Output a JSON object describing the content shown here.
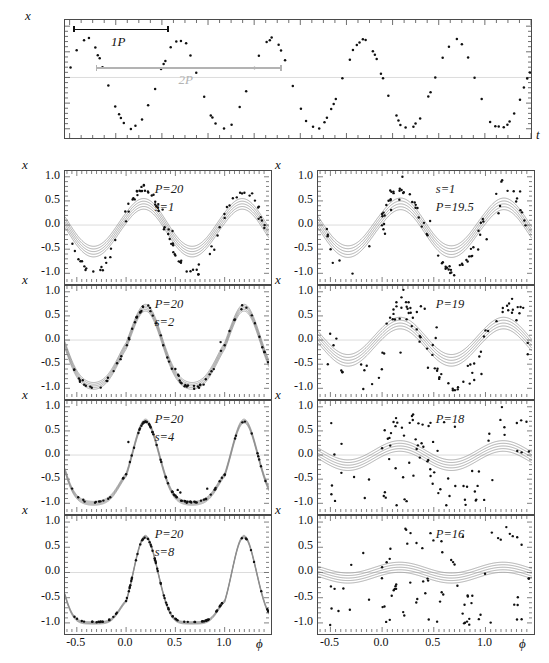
{
  "figure": {
    "axis_labels": {
      "x_var": "x",
      "time_var": "t",
      "phase_var": "ϕ"
    }
  },
  "top_panel": {
    "name": "time-series-panel",
    "ylabel": "x",
    "xlabel": "t",
    "ytick_labels": [
      "1.0",
      "0.5",
      "0.0",
      "-0.5",
      "-1.0"
    ],
    "ytick_values": [
      1.0,
      0.5,
      0.0,
      -0.5,
      -1.0
    ],
    "xtick_labels": [
      "0",
      "20",
      "40",
      "60",
      "80"
    ],
    "xtick_values": [
      0,
      20,
      40,
      60,
      80
    ],
    "xlim": [
      -1,
      100
    ],
    "ylim": [
      -1.18,
      1.12
    ],
    "legend": [
      {
        "label": "1P",
        "color": "#101010",
        "x_start": 1.2,
        "x_end": 21.5,
        "y": 0.93
      },
      {
        "label": "2P",
        "color": "#b3b3b3",
        "x_start": 6.0,
        "x_end": 46.0,
        "y": 0.18
      }
    ]
  },
  "subpanels": {
    "xtick_labels": [
      "-0.5",
      "0.0",
      "0.5",
      "1.0"
    ],
    "xtick_values": [
      -0.5,
      0.0,
      0.5,
      1.0
    ],
    "ytick_labels": [
      "1.0",
      "0.5",
      "0.0",
      "-0.5",
      "-1.0"
    ],
    "ytick_values": [
      1.0,
      0.5,
      0.0,
      -0.5,
      -1.0
    ],
    "xlim": [
      -0.62,
      1.45
    ],
    "ylim": [
      -1.18,
      1.12
    ],
    "ylabel": "x",
    "xlabel": "ϕ"
  },
  "left_column": [
    {
      "name": "panel-P20-s1",
      "annotations": [
        "P=20",
        "s=1"
      ],
      "period": 20,
      "smooth": 1,
      "scatter_sigma": 0.16,
      "band_amp": 0.55,
      "band_spread": 0.055,
      "sharp": 0.25,
      "outlier_frac": 0.3
    },
    {
      "name": "panel-P20-s2",
      "annotations": [
        "P=20",
        "s=2"
      ],
      "period": 20,
      "smooth": 2,
      "scatter_sigma": 0.055,
      "band_amp": 0.95,
      "band_spread": 0.035,
      "sharp": 0.62,
      "outlier_frac": 0.1
    },
    {
      "name": "panel-P20-s4",
      "annotations": [
        "P=20",
        "s=4"
      ],
      "period": 20,
      "smooth": 4,
      "scatter_sigma": 0.018,
      "band_amp": 1.0,
      "band_spread": 0.02,
      "sharp": 0.85,
      "outlier_frac": 0.03
    },
    {
      "name": "panel-P20-s8",
      "annotations": [
        "P=20",
        "s=8"
      ],
      "period": 20,
      "smooth": 8,
      "scatter_sigma": 0.008,
      "band_amp": 1.0,
      "band_spread": 0.012,
      "sharp": 0.97,
      "outlier_frac": 0.0
    }
  ],
  "right_column": [
    {
      "name": "panel-P19p5-s1",
      "annotations": [
        "s=1",
        "P=19.5"
      ],
      "period": 19.5,
      "smooth": 1,
      "scatter_sigma": 0.17,
      "band_amp": 0.55,
      "band_spread": 0.06,
      "sharp": 0.25,
      "outlier_frac": 0.34
    },
    {
      "name": "panel-P19",
      "annotations": [
        "P=19"
      ],
      "period": 19,
      "smooth": 1,
      "scatter_sigma": 0.3,
      "band_amp": 0.42,
      "band_spread": 0.06,
      "sharp": 0.18,
      "outlier_frac": 0.5
    },
    {
      "name": "panel-P18",
      "annotations": [
        "P=18"
      ],
      "period": 18,
      "smooth": 1,
      "scatter_sigma": 0.45,
      "band_amp": 0.21,
      "band_spread": 0.055,
      "sharp": 0.1,
      "outlier_frac": 0.68
    },
    {
      "name": "panel-P16",
      "annotations": [
        "P=16"
      ],
      "period": 16,
      "smooth": 1,
      "scatter_sigma": 0.55,
      "band_amp": 0.11,
      "band_spread": 0.05,
      "sharp": 0.05,
      "outlier_frac": 0.8
    }
  ],
  "colors": {
    "axis": "#4a4a4a",
    "data_point": "#101010",
    "band_gray": "#8c8c8c",
    "zero_line": "#dcdcdc",
    "legend_gray": "#b3b3b3"
  }
}
